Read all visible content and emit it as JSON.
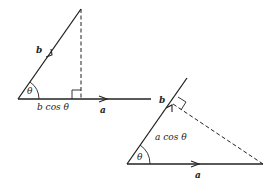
{
  "diagram": {
    "colors": {
      "stroke": "#222222",
      "background": "#ffffff"
    },
    "figure1": {
      "vector_b_label": "b",
      "vector_a_label": "a",
      "angle_label": "θ",
      "projection_label": "b cos θ",
      "description": "Projection of b onto a"
    },
    "figure2": {
      "vector_b_label": "b",
      "vector_a_label": "a",
      "angle_label": "θ",
      "projection_label": "a cos θ",
      "description": "Projection of a onto b"
    }
  }
}
